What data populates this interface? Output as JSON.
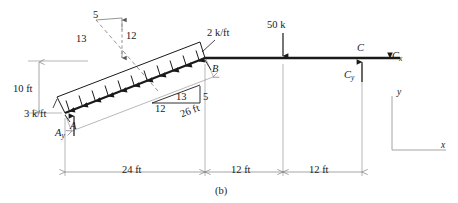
{
  "figure": {
    "caption": "(b)",
    "type": "free-body-diagram"
  },
  "labels": {
    "height_dim": "10 ft",
    "load_left": "3 k/ft",
    "load_right": "2 k/ft",
    "point_a": "A",
    "point_b": "B",
    "point_c": "C",
    "reaction_ay": "A",
    "reaction_ay_sub": "y",
    "reaction_cy": "C",
    "reaction_cy_sub": "y",
    "reaction_cx": "C",
    "reaction_cx_sub": "x",
    "point_load": "50 k",
    "member_length": "26 ft",
    "span_1": "24 ft",
    "span_2": "12 ft",
    "span_3": "12 ft",
    "axis_x": "x",
    "axis_y": "y"
  },
  "slope_triangle_upper": {
    "hypotenuse": "13",
    "vertical": "12",
    "horizontal": "5"
  },
  "slope_triangle_lower": {
    "hypotenuse": "13",
    "vertical": "5",
    "horizontal": "12"
  },
  "colors": {
    "member": "#1a1a1a",
    "dimension": "#808080",
    "text": "#1a1a1a",
    "background": "#ffffff"
  }
}
